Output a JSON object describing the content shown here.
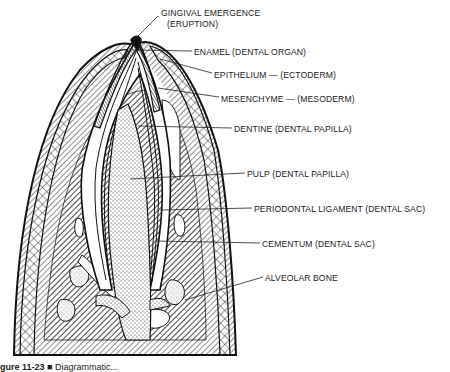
{
  "diagram": {
    "labels": [
      {
        "id": "gingival",
        "text": "GINGIVAL EMERGENCE",
        "x": 161,
        "y": 13
      },
      {
        "id": "gingival2",
        "text": "(ERUPTION)",
        "x": 167,
        "y": 24
      },
      {
        "id": "enamel",
        "text": "ENAMEL (DENTAL ORGAN)",
        "x": 194,
        "y": 47
      },
      {
        "id": "epithelium",
        "text": "EPITHELIUM — (ECTODERM)",
        "x": 214,
        "y": 70
      },
      {
        "id": "mesenchyme",
        "text": "MESENCHYME — (MESODERM)",
        "x": 221,
        "y": 94
      },
      {
        "id": "dentine",
        "text": "DENTINE (DENTAL PAPILLA)",
        "x": 234,
        "y": 125
      },
      {
        "id": "pulp",
        "text": "PULP (DENTAL PAPILLA)",
        "x": 247,
        "y": 170
      },
      {
        "id": "periodontal",
        "text": "PERIODONTAL LIGAMENT (DENTAL SAC)",
        "x": 254,
        "y": 205
      },
      {
        "id": "cementum",
        "text": "CEMENTUM (DENTAL SAC)",
        "x": 262,
        "y": 240
      },
      {
        "id": "alveolar",
        "text": "ALVEOLAR BONE",
        "x": 265,
        "y": 273
      }
    ]
  },
  "caption": {
    "figure_number": "gure 11-23",
    "marker": "■",
    "text": "Diagrammatic..."
  }
}
